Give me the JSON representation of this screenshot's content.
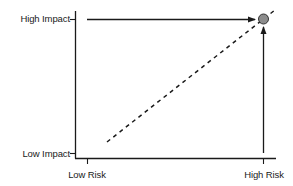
{
  "diagram": {
    "type": "risk-impact-matrix",
    "axes": {
      "y": {
        "high_label": "High Impact",
        "low_label": "Low Impact"
      },
      "x": {
        "low_label": "Low Risk",
        "high_label": "High Risk"
      }
    },
    "elements": {
      "horizontal_arrow": "arrow from High Impact tick toward point (High Risk, High Impact)",
      "vertical_arrow": "arrow from High Risk tick toward point (High Risk, High Impact)",
      "dashed_line": "diagonal dashed line from low-risk/low-impact toward high-risk/high-impact",
      "point": "gray circle at (High Risk, High Impact)"
    },
    "colors": {
      "line": "#1a1a1a",
      "point_fill": "#8c8c8c",
      "point_stroke": "#333333",
      "background": "#ffffff"
    }
  }
}
